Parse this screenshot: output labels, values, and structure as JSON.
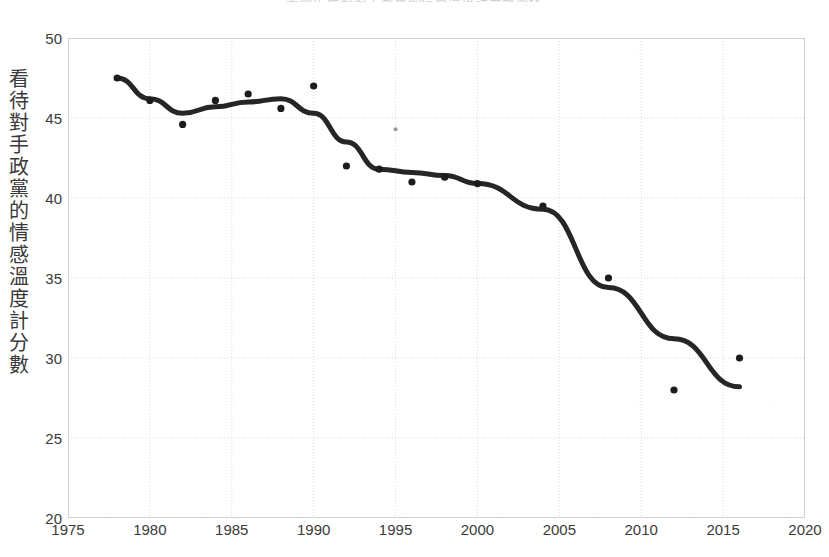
{
  "figure": {
    "background_color": "#ffffff",
    "title_clipped": "美國民眾對對手政黨的情感溫度計分數變化"
  },
  "chart_data": {
    "type": "line",
    "title": "美國民眾對對手政黨的情感溫度計分數變化",
    "xlabel": "",
    "ylabel": "看待對手政黨的情感溫度計分數",
    "ylabel_chars": [
      "看",
      "待",
      "對",
      "手",
      "政",
      "黨",
      "的",
      "情",
      "感",
      "溫",
      "度",
      "計",
      "分",
      "數"
    ],
    "xlim": [
      1975,
      2020
    ],
    "ylim": [
      20,
      50
    ],
    "xticks": [
      1975,
      1980,
      1985,
      1990,
      1995,
      2000,
      2005,
      2010,
      2015,
      2020
    ],
    "yticks": [
      20,
      25,
      30,
      35,
      40,
      45,
      50
    ],
    "grid": true,
    "legend": "none",
    "line_color": "#262626",
    "point_color": "#1c1c1c",
    "grid_color": "#d9d9d9",
    "series": [
      {
        "name": "觀測值",
        "type": "scatter",
        "points": [
          {
            "x": 1978,
            "y": 47.5
          },
          {
            "x": 1980,
            "y": 46.1
          },
          {
            "x": 1982,
            "y": 44.6
          },
          {
            "x": 1984,
            "y": 46.1
          },
          {
            "x": 1986,
            "y": 46.5
          },
          {
            "x": 1988,
            "y": 45.6
          },
          {
            "x": 1990,
            "y": 47.0
          },
          {
            "x": 1992,
            "y": 42.0
          },
          {
            "x": 1994,
            "y": 41.8
          },
          {
            "x": 1996,
            "y": 41.0
          },
          {
            "x": 1998,
            "y": 41.3
          },
          {
            "x": 2000,
            "y": 40.9
          },
          {
            "x": 2004,
            "y": 39.5
          },
          {
            "x": 2008,
            "y": 35.0
          },
          {
            "x": 2012,
            "y": 28.0
          },
          {
            "x": 2016,
            "y": 30.0
          }
        ]
      },
      {
        "name": "觀測值（淡）",
        "type": "scatter-faint",
        "points": [
          {
            "x": 1995,
            "y": 44.3
          }
        ]
      },
      {
        "name": "趨勢線",
        "type": "line",
        "points": [
          {
            "x": 1978,
            "y": 47.5
          },
          {
            "x": 1980,
            "y": 46.2
          },
          {
            "x": 1982,
            "y": 45.3
          },
          {
            "x": 1984,
            "y": 45.7
          },
          {
            "x": 1986,
            "y": 46.0
          },
          {
            "x": 1988,
            "y": 46.2
          },
          {
            "x": 1990,
            "y": 45.3
          },
          {
            "x": 1992,
            "y": 43.5
          },
          {
            "x": 1994,
            "y": 41.8
          },
          {
            "x": 1996,
            "y": 41.6
          },
          {
            "x": 1998,
            "y": 41.4
          },
          {
            "x": 2000,
            "y": 40.9
          },
          {
            "x": 2004,
            "y": 39.3
          },
          {
            "x": 2008,
            "y": 34.4
          },
          {
            "x": 2012,
            "y": 31.2
          },
          {
            "x": 2016,
            "y": 28.2
          }
        ]
      }
    ]
  }
}
